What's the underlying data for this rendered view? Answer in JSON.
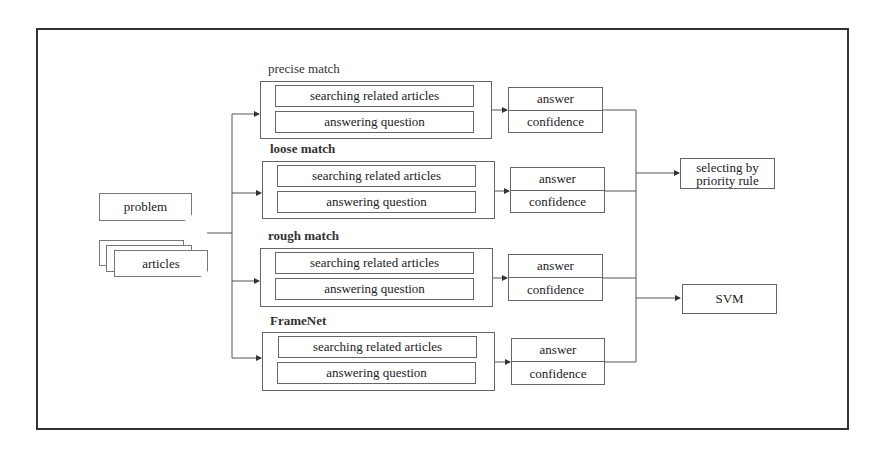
{
  "inputs": {
    "problem": "problem",
    "articles": "articles"
  },
  "groups": [
    {
      "label": "precise match",
      "search": "searching related articles",
      "answer_q": "answering question",
      "answer": "answer",
      "confidence": "confidence"
    },
    {
      "label": "loose match",
      "search": "searching related articles",
      "answer_q": "answering question",
      "answer": "answer",
      "confidence": "confidence"
    },
    {
      "label": "rough match",
      "search": "searching related articles",
      "answer_q": "answering question",
      "answer": "answer",
      "confidence": "confidence"
    },
    {
      "label": "FrameNet",
      "search": "searching related articles",
      "answer_q": "answering question",
      "answer": "answer",
      "confidence": "confidence"
    }
  ],
  "outputs": {
    "priority": "selecting by priority rule",
    "svm": "SVM"
  },
  "colors": {
    "line": "#444444",
    "frame": "#333333",
    "background": "#ffffff"
  }
}
